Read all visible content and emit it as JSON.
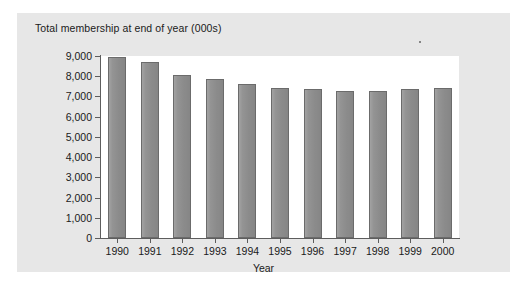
{
  "chart_data": {
    "type": "bar",
    "title": "Total membership at end of year (000s)",
    "xlabel": "Year",
    "ylabel": "",
    "categories": [
      "1990",
      "1991",
      "1992",
      "1993",
      "1994",
      "1995",
      "1996",
      "1997",
      "1998",
      "1999",
      "2000"
    ],
    "values": [
      8950,
      8700,
      8050,
      7850,
      7600,
      7400,
      7350,
      7250,
      7250,
      7350,
      7400
    ],
    "ylim": [
      0,
      9000
    ],
    "ytick_values": [
      0,
      1000,
      2000,
      3000,
      4000,
      5000,
      6000,
      7000,
      8000,
      9000
    ],
    "ytick_labels": [
      "0",
      "1,000",
      "2,000",
      "3,000",
      "4,000",
      "5,000",
      "6,000",
      "7,000",
      "8,000",
      "9,000"
    ],
    "grid": false,
    "legend": null,
    "bar_color": "#8e8e8e",
    "bar_border_color": "#6b6b6b",
    "plot_background": "#ffffff",
    "panel_background": "#e7e7e7",
    "axis_color": "#5d5d5d"
  },
  "figure": {
    "title": "Total membership at end of year (000s)",
    "axis_title_x": "Year",
    "caption_fragment": ""
  }
}
